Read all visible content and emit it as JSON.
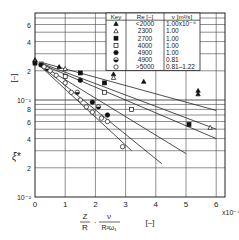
{
  "chart_data": {
    "type": "scatter",
    "title": "",
    "xlabel": "Z/R · ν/(R²ω₁)  [–]",
    "xlabel_parts": {
      "frac1_num": "Z",
      "frac1_den": "R",
      "dot": "·",
      "frac2_num": "ν",
      "frac2_den": "R²ω₁",
      "unit": "[–]"
    },
    "x_multiplier": "x10⁻⁴",
    "ylabel": "ξ*",
    "yunit": "[–]",
    "xlim": [
      0,
      6.3
    ],
    "ylim": [
      0.01,
      0.8
    ],
    "yscale": "log",
    "x_ticks": [
      "0",
      "1",
      "2",
      "3",
      "4",
      "5",
      "6"
    ],
    "y_tick_labels": [
      {
        "value": 0.6,
        "label": "6"
      },
      {
        "value": 0.4,
        "label": "4"
      },
      {
        "value": 0.2,
        "label": "2"
      },
      {
        "value": 0.1,
        "label": "10⁻¹"
      },
      {
        "value": 0.08,
        "label": "8"
      },
      {
        "value": 0.06,
        "label": "6"
      },
      {
        "value": 0.04,
        "label": "4"
      },
      {
        "value": 0.02,
        "label": "2"
      },
      {
        "value": 0.01,
        "label": "10⁻²"
      }
    ],
    "grid": true,
    "legend": {
      "position": "top-right",
      "headers": [
        "Key",
        "Re [–]",
        "ν [m²/s]"
      ],
      "rows": [
        {
          "marker": "filled-triangle",
          "re": "<2000",
          "nu": "1.00x10⁻⁶"
        },
        {
          "marker": "open-triangle",
          "re": "2300",
          "nu": "1.00"
        },
        {
          "marker": "filled-square",
          "re": "2700",
          "nu": "1.00"
        },
        {
          "marker": "open-square",
          "re": "4000",
          "nu": "1.00"
        },
        {
          "marker": "filled-circle",
          "re": "4900",
          "nu": "1.00"
        },
        {
          "marker": "half-circle",
          "re": "4900",
          "nu": "0.81"
        },
        {
          "marker": "open-circle",
          "re": ">5000",
          "nu": "0.81–1.22"
        }
      ]
    },
    "series": [
      {
        "name": "Re<2000",
        "marker": "filled-triangle",
        "x": [
          0.0,
          0.8,
          2.6,
          3.6,
          5.4,
          5.4
        ],
        "y": [
          0.26,
          0.22,
          0.185,
          0.155,
          0.125,
          0.115
        ],
        "fit_line": {
          "x": [
            0.2,
            6.0
          ],
          "y": [
            0.245,
            0.078
          ]
        }
      },
      {
        "name": "Re=2300",
        "marker": "open-triangle",
        "x": [
          0.0,
          1.0,
          2.6,
          5.8
        ],
        "y": [
          0.25,
          0.21,
          0.17,
          0.052
        ],
        "fit_line": {
          "x": [
            0.2,
            6.0
          ],
          "y": [
            0.24,
            0.05
          ]
        }
      },
      {
        "name": "Re=2700",
        "marker": "filled-square",
        "x": [
          0.0,
          1.5,
          2.3,
          5.1
        ],
        "y": [
          0.24,
          0.19,
          0.15,
          0.056
        ],
        "fit_line": {
          "x": [
            0.2,
            6.0
          ],
          "y": [
            0.235,
            0.04
          ]
        }
      },
      {
        "name": "Re=4000",
        "marker": "open-square",
        "x": [
          0.2,
          1.0,
          2.3,
          3.2
        ],
        "y": [
          0.235,
          0.175,
          0.12,
          0.08
        ],
        "fit_line": {
          "x": [
            0.2,
            5.0
          ],
          "y": [
            0.23,
            0.028
          ]
        }
      },
      {
        "name": "Re=4900 ν=1.00",
        "marker": "filled-circle",
        "x": [
          0.2,
          1.5,
          1.9,
          2.4
        ],
        "y": [
          0.23,
          0.16,
          0.095,
          0.07
        ],
        "fit_line": {
          "x": [
            0.2,
            4.2
          ],
          "y": [
            0.225,
            0.022
          ]
        }
      },
      {
        "name": "Re=4900 ν=0.81",
        "marker": "half-circle",
        "x": [
          0.4,
          1.4,
          2.1
        ],
        "y": [
          0.21,
          0.12,
          0.085
        ],
        "fit_line": null
      },
      {
        "name": "Re>5000",
        "marker": "open-circle",
        "x": [
          0.3,
          0.5,
          0.7,
          1.0,
          1.2,
          1.5,
          1.7,
          1.9,
          2.2,
          2.4,
          2.9
        ],
        "y": [
          0.22,
          0.2,
          0.18,
          0.15,
          0.12,
          0.1,
          0.085,
          0.075,
          0.065,
          0.06,
          0.033
        ],
        "fit_line": {
          "x": [
            0.2,
            3.2
          ],
          "y": [
            0.22,
            0.03
          ]
        }
      }
    ]
  }
}
